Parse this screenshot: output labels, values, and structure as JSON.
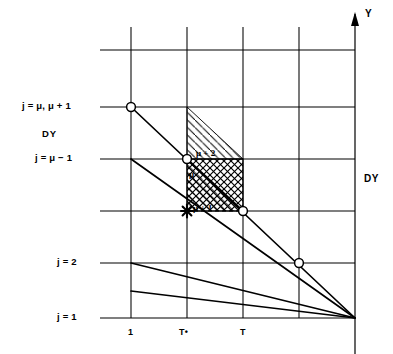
{
  "figure": {
    "axis": {
      "y_axis_label": "Y",
      "y_axis_arrow_icon": "up-arrow-icon",
      "right_spacing_label": "DY",
      "left_spacing_label": "DY"
    },
    "row_labels": [
      {
        "id": "row-mu-mu1",
        "text": "j = μ, μ + 1",
        "y": 107
      },
      {
        "id": "row-mu-minus-1",
        "text": "j = μ − 1",
        "y": 159
      },
      {
        "id": "row-j2",
        "text": "j = 2",
        "y": 263
      },
      {
        "id": "row-j1",
        "text": "j = 1",
        "y": 318
      }
    ],
    "x_tick_labels": [
      {
        "id": "tick-1",
        "text": "1",
        "x": 131
      },
      {
        "id": "tick-tstar",
        "text": "T•",
        "x": 187
      },
      {
        "id": "tick-t",
        "text": "T",
        "x": 243
      }
    ],
    "cell_annotations": [
      {
        "id": "ann-mu-plus-2",
        "text": "μ + 2"
      },
      {
        "id": "ann-mu",
        "text": "μ"
      },
      {
        "id": "ann-mu-plus-1",
        "text": "μ + 1"
      }
    ],
    "markers": {
      "open_circle_name": "open-circle-node",
      "star_name": "star-marker",
      "count_circles": 4
    },
    "colors": {
      "line": "#000000",
      "background": "#ffffff",
      "hatch": "#000000"
    }
  }
}
